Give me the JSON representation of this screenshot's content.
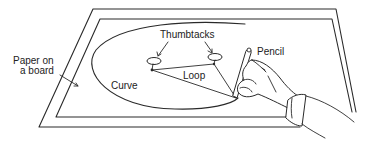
{
  "figure": {
    "labels": {
      "paper_line1": "Paper on",
      "paper_line2": "a board",
      "thumbtacks": "Thumbtacks",
      "pencil": "Pencil",
      "loop": "Loop",
      "curve": "Curve"
    },
    "colors": {
      "line": "#2a2a2a",
      "text": "#222222",
      "background": "#ffffff"
    }
  }
}
